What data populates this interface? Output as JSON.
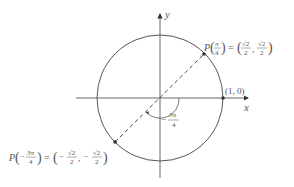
{
  "diagram": {
    "axes": {
      "x_label": "x",
      "y_label": "y"
    },
    "circle": {
      "center": [
        0,
        0
      ],
      "radius": 1
    },
    "points": [
      {
        "name": "P(π/4)",
        "P": "P",
        "arg_num": "π",
        "arg_den": "4",
        "arg_sign": "",
        "eq": "=",
        "x_sign": "",
        "x_num": "√2",
        "x_den": "2",
        "y_sign": "",
        "y_num": "√2",
        "y_den": "2"
      },
      {
        "name": "P(−3π/4)",
        "P": "P",
        "arg_num": "3π",
        "arg_den": "4",
        "arg_sign": "−",
        "eq": "=",
        "x_sign": "−",
        "x_num": "√2",
        "x_den": "2",
        "y_sign": "−",
        "y_num": "√2",
        "y_den": "2"
      },
      {
        "name": "(1, 0)",
        "label": "(1, 0)"
      }
    ],
    "angle": {
      "sign": "−",
      "num": "3π",
      "den": "4"
    },
    "colors": {
      "stroke": "#555555",
      "point": "#333333",
      "text": "#555555"
    }
  }
}
